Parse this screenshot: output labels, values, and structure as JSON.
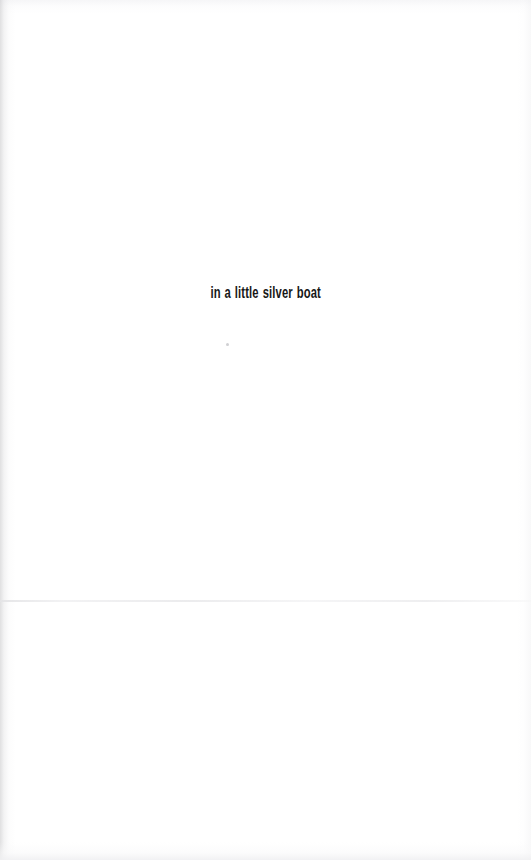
{
  "page": {
    "background_color": "#ffffff",
    "width": 531,
    "height": 860
  },
  "content": {
    "line": "in a little silver boat",
    "text_color": "#171717"
  },
  "artifacts": {
    "left_edge_shadow": "#c6c6c8",
    "right_edge_shadow": "#f0f0f2",
    "top_edge_shade": "#f4f4f6",
    "bottom_edge_shade": "#f0f0f2",
    "fold_line_color": "#e4e4e6",
    "speck_color": "#aaaaae"
  }
}
